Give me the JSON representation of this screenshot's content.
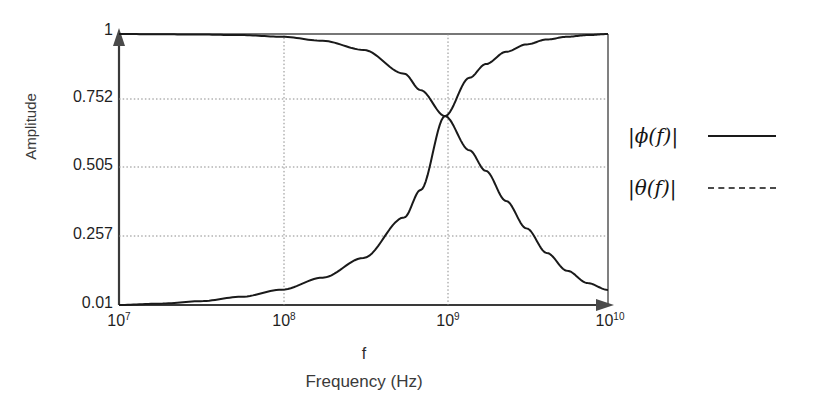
{
  "chart_data": {
    "type": "line",
    "title": "",
    "xlabel": "Frequency (Hz)",
    "xlabel_symbol": "f",
    "ylabel": "Amplitude",
    "xscale": "log",
    "xlim": [
      10000000,
      10000000000
    ],
    "ylim": [
      0.01,
      1
    ],
    "grid": true,
    "legend_position": "right",
    "xtick_labels": [
      "10",
      "10",
      "10",
      "10"
    ],
    "xtick_exponents": [
      "7",
      "8",
      "9",
      "10"
    ],
    "xtick_values": [
      10000000,
      100000000,
      1000000000,
      10000000000
    ],
    "ytick_labels": [
      "1",
      "0.752",
      "0.505",
      "0.257",
      "0.01"
    ],
    "ytick_values": [
      1,
      0.752,
      0.505,
      0.257,
      0.01
    ],
    "crossing_point": {
      "x": 1000000000,
      "y": 0.7
    },
    "series": [
      {
        "name": "|ϕ(f)|",
        "style": "solid",
        "color": "#1a1a1a",
        "x": [
          10000000,
          17800000,
          31600000,
          56200000,
          100000000,
          177800000,
          316200000,
          562300000,
          707900000,
          1000000000,
          1412500000,
          1778300000,
          2371400000,
          3162300000,
          4216900000,
          5623400000,
          7498900000,
          10000000000
        ],
        "y": [
          1.0,
          0.999,
          0.998,
          0.996,
          0.99,
          0.975,
          0.942,
          0.855,
          0.795,
          0.7,
          0.575,
          0.5,
          0.39,
          0.29,
          0.2,
          0.135,
          0.09,
          0.065
        ]
      },
      {
        "name": "|θ(f)|",
        "style": "solid",
        "color": "#1a1a1a",
        "x": [
          10000000,
          17800000,
          31600000,
          56200000,
          100000000,
          177800000,
          316200000,
          562300000,
          707900000,
          1000000000,
          1412500000,
          1778300000,
          2371400000,
          3162300000,
          4216900000,
          5623400000,
          7498900000,
          10000000000
        ],
        "y": [
          0.01,
          0.015,
          0.024,
          0.04,
          0.066,
          0.11,
          0.182,
          0.33,
          0.43,
          0.7,
          0.84,
          0.89,
          0.935,
          0.962,
          0.98,
          0.99,
          0.996,
          1.0
        ]
      }
    ],
    "legend": [
      {
        "label": "|ϕ(f)|",
        "style": "solid"
      },
      {
        "label": "|θ(f)|",
        "style": "dashed"
      }
    ]
  },
  "axes": {
    "y_title": "Amplitude",
    "x_title": "Frequency (Hz)",
    "x_symbol": "f"
  },
  "ticks": {
    "y": [
      {
        "label": "1",
        "value": 1
      },
      {
        "label": "0.752",
        "value": 0.752
      },
      {
        "label": "0.505",
        "value": 0.505
      },
      {
        "label": "0.257",
        "value": 0.257
      },
      {
        "label": "0.01",
        "value": 0.01
      }
    ],
    "x": [
      {
        "base": "10",
        "exp": "7"
      },
      {
        "base": "10",
        "exp": "8"
      },
      {
        "base": "10",
        "exp": "9"
      },
      {
        "base": "10",
        "exp": "10"
      }
    ]
  },
  "legend": {
    "entries": [
      {
        "label": "|ϕ(f)|",
        "style": "solid"
      },
      {
        "label": "|θ(f)|",
        "style": "dashed"
      }
    ]
  },
  "colors": {
    "curve": "#1a1a1a",
    "grid": "#9a9a9a",
    "frame": "#3a3a3a",
    "text": "#1f1f1f",
    "background": "#ffffff"
  }
}
